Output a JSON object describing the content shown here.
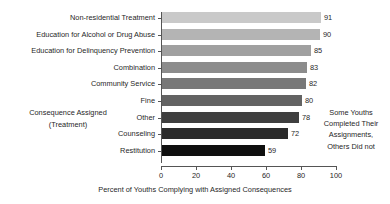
{
  "chart_data": {
    "type": "bar",
    "orientation": "horizontal",
    "title": "",
    "xlabel": "Percent of Youths Complying with Assigned Consequences",
    "ylabel": "Consequence Assigned (Treatment)",
    "ylabel_lines": [
      "Consequence Assigned",
      "(Treatment)"
    ],
    "categories": [
      "Non-residential Treatment",
      "Education for Alcohol or Drug Abuse",
      "Education for Delinquency Prevention",
      "Combination",
      "Community Service",
      "Fine",
      "Other",
      "Counseling",
      "Restitution"
    ],
    "values": [
      91,
      90,
      85,
      83,
      82,
      80,
      78,
      72,
      59
    ],
    "bar_colors": [
      "#c9c9c9",
      "#b4b4b4",
      "#a0a0a0",
      "#8c8c8c",
      "#787878",
      "#636363",
      "#3f3f3f",
      "#2b2b2b",
      "#0f0f0f"
    ],
    "xlim": [
      0,
      100
    ],
    "xticks": [
      0,
      20,
      40,
      60,
      80,
      100
    ],
    "xtick_labels": [
      "0",
      "20",
      "40",
      "60",
      "80",
      "100"
    ],
    "grid": false,
    "legend": "none",
    "data_labels": true,
    "annotations": [
      {
        "name": "right-note",
        "lines": [
          "Some Youths",
          "Completed Their",
          "Assignments,",
          "Others Did not"
        ]
      }
    ]
  }
}
